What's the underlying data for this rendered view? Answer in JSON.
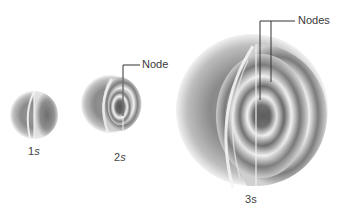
{
  "figure": {
    "orbitals": [
      {
        "id": "1s",
        "number": "1",
        "letter": "s",
        "node_count": 0
      },
      {
        "id": "2s",
        "number": "2",
        "letter": "s",
        "node_count": 1
      },
      {
        "id": "3s",
        "number": "3",
        "letter": "s",
        "node_count": 2
      }
    ],
    "callouts": {
      "node_single": "Node",
      "node_plural": "Nodes"
    },
    "colors": {
      "sphere_dark": "#6e6e6e",
      "sphere_mid": "#a9a9a9",
      "sphere_light": "#e6e6e6",
      "background": "#ffffff",
      "leader_line": "#333333"
    }
  }
}
